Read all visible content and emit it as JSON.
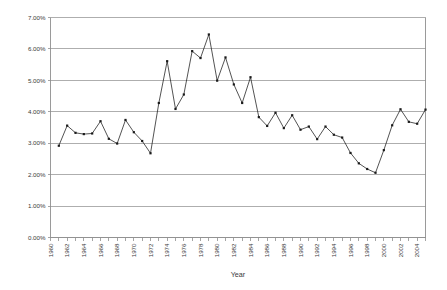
{
  "chart_data": {
    "type": "line",
    "title": "",
    "xlabel": "Year",
    "ylabel": "",
    "x": [
      1961,
      1962,
      1963,
      1964,
      1965,
      1966,
      1967,
      1968,
      1969,
      1970,
      1971,
      1972,
      1973,
      1974,
      1975,
      1976,
      1977,
      1978,
      1979,
      1980,
      1981,
      1982,
      1983,
      1984,
      1985,
      1986,
      1987,
      1988,
      1989,
      1990,
      1991,
      1992,
      1993,
      1994,
      1995,
      1996,
      1997,
      1998,
      1999,
      2000,
      2001,
      2002,
      2003,
      2004,
      2005
    ],
    "values": [
      2.92,
      3.56,
      3.33,
      3.29,
      3.31,
      3.7,
      3.14,
      2.99,
      3.74,
      3.35,
      3.07,
      2.68,
      4.28,
      5.61,
      4.09,
      4.55,
      5.93,
      5.71,
      6.46,
      4.99,
      5.73,
      4.87,
      4.28,
      5.1,
      3.83,
      3.55,
      3.97,
      3.48,
      3.89,
      3.43,
      3.53,
      3.13,
      3.53,
      3.27,
      3.18,
      2.69,
      2.36,
      2.18,
      2.06,
      2.78,
      3.57,
      4.08,
      3.68,
      3.62,
      4.07
    ],
    "series": [
      {
        "name": "rate",
        "values": [
          2.92,
          3.56,
          3.33,
          3.29,
          3.31,
          3.7,
          3.14,
          2.99,
          3.74,
          3.35,
          3.07,
          2.68,
          4.28,
          5.61,
          4.09,
          4.55,
          5.93,
          5.71,
          6.46,
          4.99,
          5.73,
          4.87,
          4.28,
          5.1,
          3.83,
          3.55,
          3.97,
          3.48,
          3.89,
          3.43,
          3.53,
          3.13,
          3.53,
          3.27,
          3.18,
          2.69,
          2.36,
          2.18,
          2.06,
          2.78,
          3.57,
          4.08,
          3.68,
          3.62,
          4.07
        ]
      }
    ],
    "xlim": [
      1960,
      2005
    ],
    "ylim": [
      0,
      7
    ],
    "ytick_values": [
      0,
      1,
      2,
      3,
      4,
      5,
      6,
      7
    ],
    "ytick_labels": [
      "0.00%",
      "1.00%",
      "2.00%",
      "3.00%",
      "4.00%",
      "5.00%",
      "6.00%",
      "7.00%"
    ],
    "xtick_values": [
      1960,
      1961,
      1962,
      1963,
      1964,
      1965,
      1966,
      1967,
      1968,
      1969,
      1970,
      1971,
      1972,
      1973,
      1974,
      1975,
      1976,
      1977,
      1978,
      1979,
      1980,
      1981,
      1982,
      1983,
      1984,
      1985,
      1986,
      1987,
      1988,
      1989,
      1990,
      1991,
      1992,
      1993,
      1994,
      1995,
      1996,
      1997,
      1998,
      1999,
      2000,
      2001,
      2002,
      2003,
      2004,
      2005
    ],
    "xtick_labels": [
      "1960",
      "",
      "1962",
      "",
      "1964",
      "",
      "1966",
      "",
      "1968",
      "",
      "1970",
      "",
      "1972",
      "",
      "1974",
      "",
      "1976",
      "",
      "1978",
      "",
      "1980",
      "",
      "1982",
      "",
      "1984",
      "",
      "1986",
      "",
      "1988",
      "",
      "1990",
      "",
      "1992",
      "",
      "1994",
      "",
      "1996",
      "",
      "1998",
      "",
      "2000",
      "",
      "2002",
      "",
      "2004",
      ""
    ],
    "grid": true,
    "grid_axis": "y",
    "legend": false,
    "legend_position": "none",
    "markers": true,
    "line_color": "#1a1a1a",
    "grid_color": "#9a9a9a",
    "background_color": "#ffffff",
    "xtick_label_rotation": -90
  },
  "axis_titles": {
    "x": "Year"
  }
}
